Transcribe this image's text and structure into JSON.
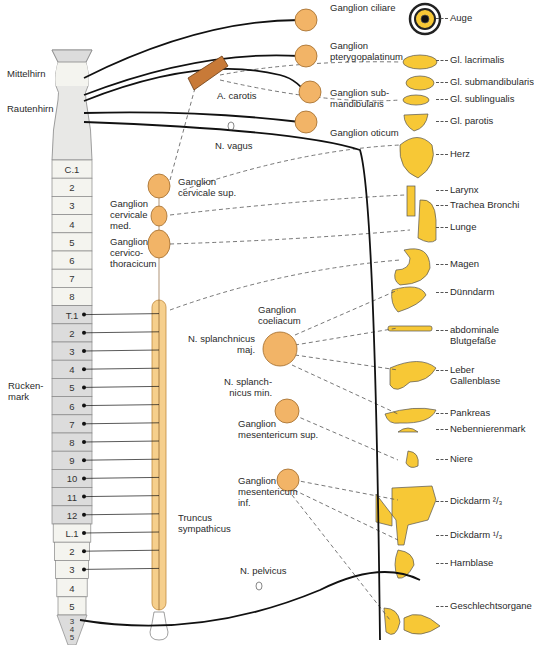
{
  "colors": {
    "ganglion_fill": "#f2b467",
    "organ_fill": "#f7c836",
    "cord_light": "#f4f4ef",
    "cord_shade": "#dcdcdc",
    "trunk_fill": "#f6cf8c",
    "nerve": "#111111",
    "dashed": "#555555"
  },
  "brain_labels": {
    "mittelhirn": "Mittelhirn",
    "rautenhirn": "Rautenhirn",
    "rueckenmark": "Rücken-\nmark"
  },
  "spinal_segments": [
    {
      "label": "C.1",
      "y": 168,
      "shade": "light"
    },
    {
      "label": "2",
      "y": 186,
      "shade": "light"
    },
    {
      "label": "3",
      "y": 204,
      "shade": "light"
    },
    {
      "label": "4",
      "y": 222,
      "shade": "light"
    },
    {
      "label": "5",
      "y": 240,
      "shade": "light"
    },
    {
      "label": "6",
      "y": 258,
      "shade": "light"
    },
    {
      "label": "7",
      "y": 276,
      "shade": "light"
    },
    {
      "label": "8",
      "y": 294,
      "shade": "light"
    },
    {
      "label": "T.1",
      "y": 312,
      "shade": "dark"
    },
    {
      "label": "2",
      "y": 330,
      "shade": "dark"
    },
    {
      "label": "3",
      "y": 348,
      "shade": "dark"
    },
    {
      "label": "4",
      "y": 366,
      "shade": "dark"
    },
    {
      "label": "5",
      "y": 384,
      "shade": "dark"
    },
    {
      "label": "6",
      "y": 402,
      "shade": "dark"
    },
    {
      "label": "7",
      "y": 420,
      "shade": "dark"
    },
    {
      "label": "8",
      "y": 438,
      "shade": "dark"
    },
    {
      "label": "9",
      "y": 456,
      "shade": "dark"
    },
    {
      "label": "10",
      "y": 474,
      "shade": "dark"
    },
    {
      "label": "11",
      "y": 492,
      "shade": "dark"
    },
    {
      "label": "12",
      "y": 510,
      "shade": "dark"
    },
    {
      "label": "L.1",
      "y": 528,
      "shade": "light"
    },
    {
      "label": "2",
      "y": 546,
      "shade": "light"
    },
    {
      "label": "3",
      "y": 564,
      "shade": "light"
    },
    {
      "label": "4",
      "y": 582,
      "shade": "light"
    },
    {
      "label": "5",
      "y": 600,
      "shade": "light"
    },
    {
      "label": "S.1",
      "y": 618,
      "shade": "dark"
    },
    {
      "label": "2",
      "y": 636,
      "shade": "dark"
    }
  ],
  "sacral_extra": [
    "3",
    "4",
    "5"
  ],
  "ganglia": {
    "ciliare": "Ganglion ciliare",
    "pterygopalatinum": "Ganglion\npterygopalatinum",
    "submandibularis": "Ganglion sub-\nmandibularis",
    "oticum": "Ganglion oticum",
    "cervicale_sup": "Ganglion\ncervicale sup.",
    "cervicale_med": "Ganglion\ncervicale\nmed.",
    "cervicothoracicum": "Ganglion\ncervico-\nthoracicum",
    "coeliacum": "Ganglion\ncoeliacum",
    "mesentericum_sup": "Ganglion\nmesentericum sup.",
    "mesentericum_inf": "Ganglion\nmesentericum\ninf."
  },
  "nerves": {
    "carotis": "A. carotis",
    "vagus": "N. vagus",
    "splanchnicus_maj": "N. splanchnicus\nmaj.",
    "splanchnicus_min": "N. splanch-\nnicus min.",
    "truncus": "Truncus\nsympathicus",
    "pelvicus": "N. pelvicus"
  },
  "organs": [
    {
      "label": "Auge",
      "y": 18
    },
    {
      "label": "Gl. lacrimalis",
      "y": 60
    },
    {
      "label": "Gl. submandibularis",
      "y": 82
    },
    {
      "label": "Gl. sublingualis",
      "y": 99
    },
    {
      "label": "Gl. parotis",
      "y": 121
    },
    {
      "label": "Herz",
      "y": 154
    },
    {
      "label": "Larynx",
      "y": 190
    },
    {
      "label": "Trachea Bronchi",
      "y": 205
    },
    {
      "label": "Lunge",
      "y": 227
    },
    {
      "label": "Magen",
      "y": 264
    },
    {
      "label": "Dünndarm",
      "y": 292
    },
    {
      "label": "abdominale\nBlutgefäße",
      "y": 330
    },
    {
      "label": "Leber\nGallenblase",
      "y": 370
    },
    {
      "label": "Pankreas",
      "y": 413
    },
    {
      "label": "Nebennierenmark",
      "y": 429
    },
    {
      "label": "Niere",
      "y": 459
    },
    {
      "label": "Dickdarm ²/₃",
      "y": 501
    },
    {
      "label": "Dickdarm ¹/₃",
      "y": 535
    },
    {
      "label": "Harnblase",
      "y": 563
    },
    {
      "label": "Geschlechtsorgane",
      "y": 606
    }
  ]
}
